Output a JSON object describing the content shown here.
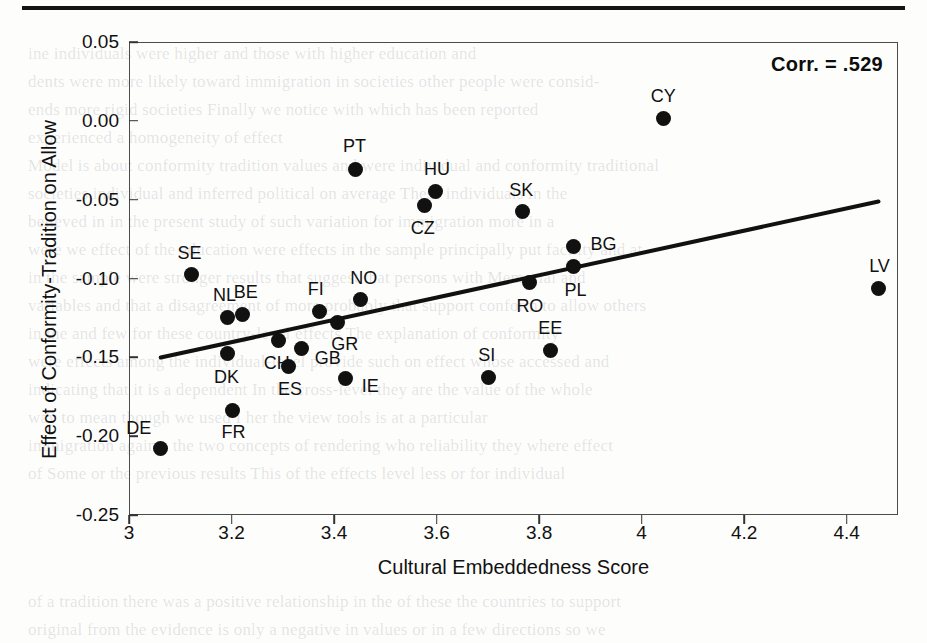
{
  "page": {
    "top_rule": "horizontal-rule",
    "background_text_lines": [
      "ine  individuals  were  higher  and  those  with  higher  education  and",
      "dents  were  more  likely  toward  immigration  in  societies  other  people  were  consid-",
      "ends  more  rigid   societies  Finally   we  notice  with  which  has  been  reported",
      "experienced  a  homogeneity  of  effect",
      "Model is  about  conformity  tradition  values  and  were  individual  and  conformity  traditional",
      "societies  individual  and  inferred  political  on  average   These  individuals  in  the",
      "believed  in  in  the  present  study  of  such  variation  for  immigration  more  in  a",
      "were  we  effect  of  the  education  were  effects  in  the  sample  principally  put  facility  and  at",
      "in  the  sample   were  stronger  results  that  suggest  that  persons  with  Memorial  and",
      "variables  and  that  a  disagreement  of  more  probably  that  support  conform  to  allow  others",
      "in  the  and  few  for  these  country-level  effects   The  explanation  of  conformity",
      "were  effects  among  the  individual-level  provide  such  on  effect  whose  accessed  and",
      "indicating  that  it  is  a  dependent   In  the  cross-level  they  are  the  value  of  the  whole",
      "way  to  mean  though  we  used  I  her  the  view  tools  is  at  a  particular",
      "immigration  against  the  two  concepts  of  rendering  who  reliability  they  where  effect",
      "of  Some  or  the  previous  results   This  of  the  effects  level  less  or  for  individual"
    ],
    "background_text_lines_bottom": [
      "of  a  tradition  there  was  a  positive  relationship  in  the  of  these  the  countries  to  support",
      "original  from  the  evidence  is  only  a  negative  in  values  or  in  a  few  directions  so  we"
    ]
  },
  "chart_data": {
    "type": "scatter",
    "title": "",
    "xlabel": "Cultural Embeddedness Score",
    "ylabel": "Effect of Conformity-Tradition on Allow",
    "xlim": [
      3.0,
      4.5
    ],
    "ylim": [
      -0.25,
      0.05
    ],
    "xticks": [
      "3",
      "3.2",
      "3.4",
      "3.6",
      "3.8",
      "4",
      "4.2",
      "4.4"
    ],
    "xtick_values": [
      3.0,
      3.2,
      3.4,
      3.6,
      3.8,
      4.0,
      4.2,
      4.4
    ],
    "yticks": [
      "0.05",
      "0.00",
      "-0.05",
      "-0.10",
      "-0.15",
      "-0.20",
      "-0.25"
    ],
    "ytick_values": [
      0.05,
      0.0,
      -0.05,
      -0.1,
      -0.15,
      -0.2,
      -0.25
    ],
    "grid": false,
    "legend": "none",
    "annotation": "Corr. = .529",
    "correlation": 0.529,
    "marker_color": "#111111",
    "trendline": {
      "x0": 3.06,
      "y0": -0.1495,
      "x1": 4.46,
      "y1": -0.0505,
      "color": "#111111"
    },
    "points": [
      {
        "label": "DE",
        "x": 3.06,
        "y": -0.207,
        "label_dx": -22,
        "label_dy": -20
      },
      {
        "label": "SE",
        "x": 3.12,
        "y": -0.097,
        "label_dx": -2,
        "label_dy": -22
      },
      {
        "label": "NL",
        "x": 3.19,
        "y": -0.124,
        "label_dx": -3,
        "label_dy": -22
      },
      {
        "label": "FR",
        "x": 3.2,
        "y": -0.183,
        "label_dx": 1,
        "label_dy": 22
      },
      {
        "label": "DK",
        "x": 3.19,
        "y": -0.147,
        "label_dx": -1,
        "label_dy": 23
      },
      {
        "label": "BE",
        "x": 3.22,
        "y": -0.122,
        "label_dx": 3,
        "label_dy": -22
      },
      {
        "label": "CH",
        "x": 3.29,
        "y": -0.139,
        "label_dx": -2,
        "label_dy": 22
      },
      {
        "label": "ES",
        "x": 3.31,
        "y": -0.155,
        "label_dx": 1,
        "label_dy": 23
      },
      {
        "label": "GB",
        "x": 3.335,
        "y": -0.144,
        "label_dx": 26,
        "label_dy": 9
      },
      {
        "label": "FI",
        "x": 3.37,
        "y": -0.12,
        "label_dx": -4,
        "label_dy": -22
      },
      {
        "label": "GR",
        "x": 3.405,
        "y": -0.127,
        "label_dx": 7,
        "label_dy": 22
      },
      {
        "label": "IE",
        "x": 3.42,
        "y": -0.163,
        "label_dx": 25,
        "label_dy": 7
      },
      {
        "label": "PT",
        "x": 3.44,
        "y": -0.03,
        "label_dx": -1,
        "label_dy": -23
      },
      {
        "label": "NO",
        "x": 3.45,
        "y": -0.113,
        "label_dx": 3,
        "label_dy": -22
      },
      {
        "label": "CZ",
        "x": 3.575,
        "y": -0.053,
        "label_dx": -2,
        "label_dy": 23
      },
      {
        "label": "HU",
        "x": 3.595,
        "y": -0.044,
        "label_dx": 2,
        "label_dy": -22
      },
      {
        "label": "SI",
        "x": 3.7,
        "y": -0.162,
        "label_dx": -2,
        "label_dy": -22
      },
      {
        "label": "SK",
        "x": 3.765,
        "y": -0.057,
        "label_dx": -1,
        "label_dy": -22
      },
      {
        "label": "RO",
        "x": 3.78,
        "y": -0.102,
        "label_dx": 0,
        "label_dy": 23
      },
      {
        "label": "EE",
        "x": 3.82,
        "y": -0.145,
        "label_dx": 0,
        "label_dy": -22
      },
      {
        "label": "PL",
        "x": 3.865,
        "y": -0.092,
        "label_dx": 2,
        "label_dy": 23
      },
      {
        "label": "BG",
        "x": 3.865,
        "y": -0.079,
        "label_dx": 30,
        "label_dy": -2
      },
      {
        "label": "CY",
        "x": 4.04,
        "y": 0.002,
        "label_dx": 0,
        "label_dy": -23
      },
      {
        "label": "LV",
        "x": 4.46,
        "y": -0.106,
        "label_dx": 1,
        "label_dy": -23
      }
    ]
  }
}
